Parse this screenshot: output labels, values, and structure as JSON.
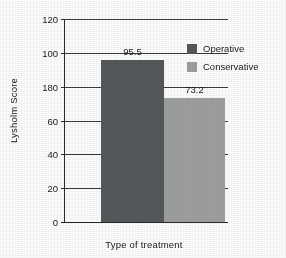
{
  "chart_data": {
    "type": "bar",
    "title": "",
    "xlabel": "Type of treatment",
    "ylabel": "Lysholm Score",
    "categories": [
      "Operative",
      "Conservative"
    ],
    "values": [
      95.5,
      73.2
    ],
    "value_labels": [
      "95.5",
      "73.2"
    ],
    "ylim": [
      0,
      120
    ],
    "yticks": [
      0,
      20,
      40,
      60,
      80,
      100,
      120
    ],
    "ytick_labels": [
      "0",
      "20",
      "40",
      "60",
      "180",
      "100",
      "120"
    ],
    "grid": true,
    "legend_position": "top-right-inside",
    "legend": [
      {
        "label": "Operative",
        "color": "#555a5c"
      },
      {
        "label": "Conservative",
        "color": "#a0a2a2"
      }
    ],
    "colors": {
      "operative": "#555a5c",
      "conservative": "#a0a2a2",
      "axis": "#2b2b2b",
      "grid": "#3a3a3a",
      "background": "#ffffff"
    }
  }
}
